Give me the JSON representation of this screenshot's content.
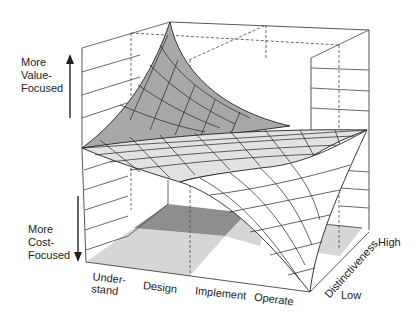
{
  "diagram": {
    "type": "3d-surface-saddle",
    "vertical_axis": {
      "top_label": "More\nValue-\nFocused",
      "bottom_label": "More\nCost-\nFocused"
    },
    "x_axis": {
      "ticks": [
        "Under-\nstand",
        "Design",
        "Implement",
        "Operate"
      ]
    },
    "depth_axis": {
      "label": "Distinctiveness",
      "high": "High",
      "low": "Low"
    },
    "colors": {
      "line": "#222222",
      "surface_dark": "#a8a8a8",
      "surface_light": "#e2e2e2",
      "floor_light": "#d4d4d4",
      "floor_dark": "#8a8a8a",
      "box": "#444444"
    }
  }
}
